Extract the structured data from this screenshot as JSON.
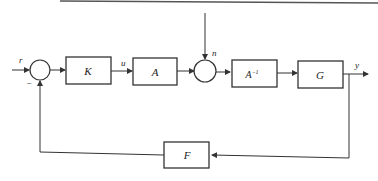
{
  "diagram": {
    "type": "block-diagram",
    "signals": {
      "input": "r",
      "control": "u",
      "disturbance": "n",
      "output": "y",
      "minus_sign": "−"
    },
    "blocks": {
      "K": "K",
      "A": "A",
      "A_inv": "A",
      "A_inv_sup": "−1",
      "G": "G",
      "F": "F"
    },
    "colors": {
      "line": "#333333",
      "background": "#ffffff"
    }
  }
}
